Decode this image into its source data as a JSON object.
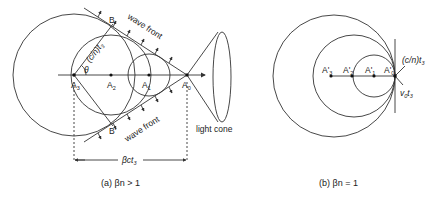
{
  "panel_a": {
    "caption": "(a) βn > 1",
    "labels": {
      "B_top": "B",
      "B_bottom": "B'",
      "wave_front_top": "wave front",
      "wave_front_bottom": "wave front",
      "radius": "(c/n)t",
      "radius_sub": "3",
      "theta": "θ",
      "A3": "A",
      "A3_sub": "3",
      "A2": "A",
      "A2_sub": "2",
      "A1": "A",
      "A1_sub": "1",
      "A0": "A",
      "A0_sub": "0",
      "light_cone": "light cone",
      "distance": "βct",
      "distance_sub": "3"
    }
  },
  "panel_b": {
    "caption": "(b) βn = 1",
    "labels": {
      "A3": "A'",
      "A3_sub": "3",
      "A2": "A'",
      "A2_sub": "2",
      "A1": "A'",
      "A1_sub": "1",
      "A0": "A'",
      "A0_sub": "0",
      "radius": "(c/n)t",
      "radius_sub": "3",
      "velocity": "v",
      "velocity_sub1": "0",
      "velocity_t": "t",
      "velocity_sub2": "3"
    }
  },
  "colors": {
    "stroke": "#333333",
    "text": "#222222",
    "background": "#ffffff"
  }
}
